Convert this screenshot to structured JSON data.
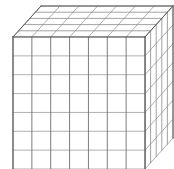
{
  "figure": {
    "title": "Base-ten block cube wireframe",
    "kind": "isometric-wireframe-cube",
    "background_color": "#ffffff"
  },
  "chart_data": {
    "type": "diagram",
    "title": "Base-ten block cube wireframe",
    "projection": "oblique-cabinet",
    "grid": {
      "front_columns": 7,
      "front_rows": 7,
      "depth_slabs": 5
    },
    "geometry": {
      "front_left_x": 13,
      "front_top_y": 37,
      "front_right_x": 145,
      "front_bottom_y": 169,
      "cell_width": 18.857,
      "cell_height": 18.857,
      "depth_dx": 5.6,
      "depth_dy": -6.2
    },
    "colors": {
      "front_vertical": "#6e6e6e",
      "front_horizontal": "#a8a8a8",
      "top_lines": "#9a9a9a",
      "side_lines": "#9a9a9a",
      "outline": "#5a5a5a",
      "face_fill": "#ffffff"
    }
  }
}
